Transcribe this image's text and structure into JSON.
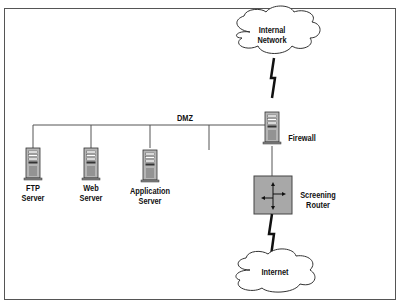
{
  "diagram": {
    "title": "",
    "nodes": {
      "internal_network": {
        "line1": "Internal",
        "line2": "Network"
      },
      "firewall": "Firewall",
      "dmz": "DMZ",
      "ftp_server": {
        "line1": "FTP",
        "line2": "Server"
      },
      "web_server": {
        "line1": "Web",
        "line2": "Server"
      },
      "app_server": {
        "line1": "Application",
        "line2": "Server"
      },
      "router": {
        "line1": "Screening",
        "line2": "Router"
      },
      "internet": "Internet"
    },
    "colors": {
      "router_fill": "#a8a8a8",
      "server_fill": "#b0b0b0",
      "line": "#555555",
      "bolt": "#111111"
    }
  }
}
